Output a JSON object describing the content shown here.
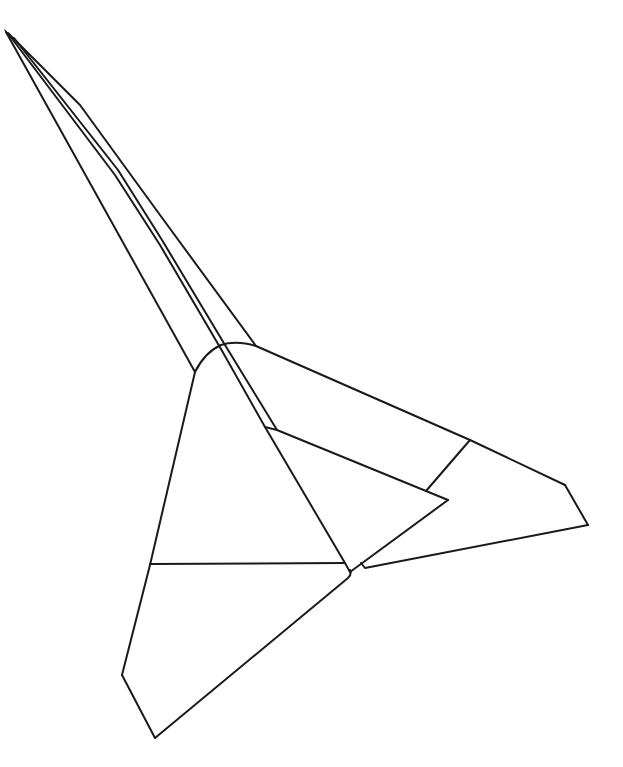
{
  "drawing": {
    "subject": "paper airplane line drawing",
    "stroke_color": "#1a1a1a",
    "background_color": "#ffffff",
    "stroke_width": 2
  }
}
